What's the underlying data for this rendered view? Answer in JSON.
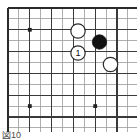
{
  "figure": {
    "caption": "図10",
    "kind": "go-board-diagram",
    "board_size": 19,
    "colors": {
      "background": "#ffffff",
      "line_thin": "#9a9a9a",
      "line_thick": "#3a3a3a",
      "border": "#2b2b2b",
      "black_stone": "#111111",
      "white_stone_fill": "#ffffff",
      "white_stone_stroke": "#2b2b2b",
      "star_point": "#222222",
      "caption_text": "#4a4a4a"
    },
    "geometry": {
      "origin_x": 8,
      "origin_y": 8,
      "spacing": 10.9,
      "cols": 12,
      "rows": 12,
      "stone_radius": 7.2,
      "star_radius": 1.9,
      "border_width": 2.0,
      "thick_width": 1.3,
      "thin_width": 0.8
    }
  },
  "chart_data": {
    "type": "table",
    "title": "図10",
    "xlabel": "",
    "ylabel": "",
    "grid": true,
    "legend": "none",
    "grid_lines": {
      "vertical": [
        8,
        18.9,
        29.8,
        40.7,
        51.6,
        62.5,
        73.4,
        84.3,
        95.2,
        106.1,
        117,
        127.9
      ],
      "horizontal": [
        8,
        18.9,
        29.8,
        40.7,
        51.6,
        62.5,
        73.4,
        84.3,
        95.2,
        106.1,
        117,
        127.9
      ],
      "thick_vertical": [
        8,
        29.8,
        51.6,
        73.4,
        95.2,
        117
      ],
      "thick_horizontal": [
        8,
        29.8,
        51.6,
        73.4,
        95.2,
        117
      ]
    },
    "star_points": [
      {
        "x": 29.8,
        "y": 29.8
      },
      {
        "x": 29.8,
        "y": 106.1
      },
      {
        "x": 95.2,
        "y": 106.1
      }
    ],
    "stones": [
      {
        "id": "white-a",
        "color": "white",
        "x": 78.0,
        "y": 31.0,
        "label": ""
      },
      {
        "id": "black-a",
        "color": "black",
        "x": 99.5,
        "y": 42.0,
        "label": ""
      },
      {
        "id": "white-move-1",
        "color": "white",
        "x": 78.0,
        "y": 53.0,
        "label": "1"
      },
      {
        "id": "white-b",
        "color": "white",
        "x": 110.5,
        "y": 64.5,
        "label": ""
      }
    ]
  }
}
